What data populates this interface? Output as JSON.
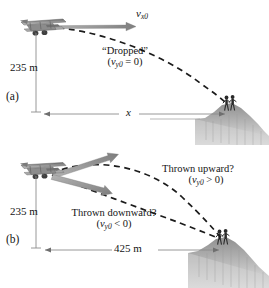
{
  "figure": {
    "colors": {
      "ink": "#141414",
      "dash": "#1b1b1b",
      "arrow_gray": "#9a9a9a",
      "dim_line": "#8d8d8d",
      "terrain": "#b9b9b9",
      "plane_body": "#8a8a8a",
      "background": "#ffffff"
    }
  },
  "panel_a": {
    "id": "(a)",
    "velocity_label": "v",
    "velocity_sub": "x0",
    "height_label": "235 m",
    "range_label": "x",
    "note_line1": "“Dropped”",
    "note_open": "(",
    "note_var": "v",
    "note_sub": "y0",
    "note_rel": " = 0)",
    "plane_icon": "biplane-icon",
    "people_icon": "observers-icon",
    "terrain_icon": "cliff-icon",
    "trajectory_kind": "dashed-parabola"
  },
  "panel_b": {
    "id": "(b)",
    "height_label": "235 m",
    "range_label": "425 m",
    "up_note_line1": "Thrown upward?",
    "up_note_open": "(",
    "up_note_var": "v",
    "up_note_sub": "y0",
    "up_note_rel": " > 0)",
    "down_note_line1": "Thrown downward?",
    "down_note_open": "(",
    "down_note_var": "v",
    "down_note_sub": "y0",
    "down_note_rel": " < 0)",
    "plane_icon": "biplane-icon",
    "people_icon": "observers-icon",
    "terrain_icon": "cliff-icon",
    "trajectory_kind": "dashed-parabola-pair"
  }
}
